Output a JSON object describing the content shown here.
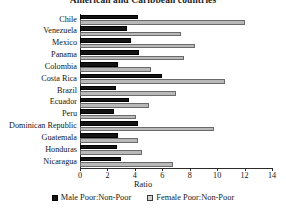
{
  "chart_data": {
    "type": "bar",
    "orientation": "horizontal",
    "title": "American and Caribbean countries",
    "xlabel": "Ratio",
    "ylabel": "",
    "xlim": [
      0,
      14
    ],
    "xticks": [
      0,
      2,
      4,
      6,
      8,
      10,
      12,
      14
    ],
    "grid": false,
    "legend_position": "bottom",
    "categories": [
      "Chile",
      "Venezuela",
      "Mexico",
      "Panama",
      "Colombia",
      "Costa Rica",
      "Brazil",
      "Ecuador",
      "Peru",
      "Dominican Republic",
      "Guatemala",
      "Honduras",
      "Nicaragua"
    ],
    "series": [
      {
        "name": "Male Poor:Non-Poor",
        "color": "#141414",
        "values": [
          4.2,
          3.4,
          3.7,
          4.3,
          2.8,
          6.0,
          2.6,
          3.6,
          2.5,
          4.2,
          2.8,
          2.7,
          3.0
        ]
      },
      {
        "name": "Female Poor:Non-Poor",
        "color": "#b9b9b9",
        "values": [
          12.0,
          7.4,
          8.4,
          7.6,
          5.2,
          10.6,
          7.0,
          5.0,
          4.1,
          9.8,
          4.2,
          4.5,
          6.8
        ]
      }
    ]
  },
  "legend": {
    "items": [
      {
        "label": "Male Poor:Non-Poor"
      },
      {
        "label": "Female Poor:Non-Poor"
      }
    ]
  }
}
